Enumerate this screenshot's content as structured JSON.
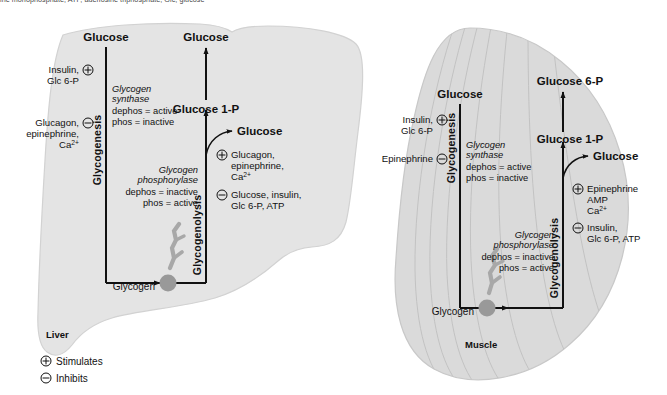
{
  "figure": {
    "caption_partial": "ine monophosphate; ATP, adenosine triphosphate; Glc, glucose",
    "background_color": "#ffffff",
    "organ_fill": "#e4e4e4",
    "organ_stroke": "#cfcfcf",
    "glycogen_color": "#9a9a9a",
    "arrow_color": "#111111"
  },
  "legend": {
    "stimulates": {
      "symbol": "+",
      "label": "Stimulates"
    },
    "inhibits": {
      "symbol": "-",
      "label": "Inhibits"
    }
  },
  "liver": {
    "organ_label": "Liver",
    "glycogen_label": "Glycogen",
    "glycogenesis": {
      "pathway_label": "Glycogenesis",
      "top_substrate": "Glucose",
      "enzyme_name_line1": "Glycogen",
      "enzyme_name_line2": "synthase",
      "enzyme_state_line1": "dephos = active",
      "enzyme_state_line2": "phos = inactive",
      "stimulators": {
        "symbol": "+",
        "line1": "Insulin,",
        "line2": "Glc 6-P"
      },
      "inhibitors": {
        "symbol": "-",
        "line1": "Glucagon,",
        "line2": "epinephrine,",
        "line3": "Ca2+"
      }
    },
    "glycogenolysis": {
      "pathway_label": "Glycogenolysis",
      "top_product": "Glucose",
      "intermediate": "Glucose 1-P",
      "branch_product": "Glucose",
      "enzyme_name_line1": "Glycogen",
      "enzyme_name_line2": "phosphorylase",
      "enzyme_state_line1": "dephos = inactive",
      "enzyme_state_line2": "phos = active",
      "stimulators": {
        "symbol": "+",
        "line1": "Glucagon,",
        "line2": "epinephrine,",
        "line3": "Ca2+"
      },
      "inhibitors": {
        "symbol": "-",
        "line1": "Glucose, insulin,",
        "line2": "Glc 6-P, ATP"
      }
    }
  },
  "muscle": {
    "organ_label": "Muscle",
    "glycogen_label": "Glycogen",
    "glycogenesis": {
      "pathway_label": "Glycogenesis",
      "top_substrate": "Glucose",
      "enzyme_name_line1": "Glycogen",
      "enzyme_name_line2": "synthase",
      "enzyme_state_line1": "dephos = active",
      "enzyme_state_line2": "phos = inactive",
      "stimulators": {
        "symbol": "+",
        "line1": "Insulin,",
        "line2": "Glc 6-P"
      },
      "inhibitors": {
        "symbol": "-",
        "line1": "Epinephrine"
      }
    },
    "glycogenolysis": {
      "pathway_label": "Glycogenolysis",
      "top_product": "Glucose 6-P",
      "intermediate": "Glucose 1-P",
      "branch_product": "Glucose",
      "enzyme_name_line1": "Glycogen",
      "enzyme_name_line2": "phosphorylase",
      "enzyme_state_line1": "dephos = inactive",
      "enzyme_state_line2": "phos = active",
      "stimulators": {
        "symbol": "+",
        "line1": "Epinephrine",
        "line2": "AMP",
        "line3": "Ca2+"
      },
      "inhibitors": {
        "symbol": "-",
        "line1": "Insulin,",
        "line2": "Glc 6-P, ATP"
      }
    }
  }
}
